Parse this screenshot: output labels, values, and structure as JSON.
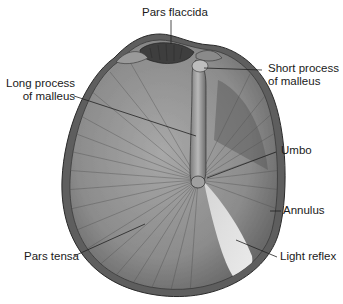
{
  "diagram": {
    "labels": {
      "pars_flaccida": "Pars flaccida",
      "short_process_line1": "Short process",
      "short_process_line2": "of malleus",
      "long_process_line1": "Long process",
      "long_process_line2": "of malleus",
      "umbo": "Umbo",
      "annulus": "Annulus",
      "pars_tensa": "Pars tensa",
      "light_reflex": "Light reflex"
    },
    "colors": {
      "membrane": "#8a8a8a",
      "membrane_dark": "#4a4a4a",
      "rim": "#5a5a5a",
      "light_reflex": "#e6e6e6",
      "leader_line": "#222222",
      "text": "#1a1a1a"
    }
  }
}
